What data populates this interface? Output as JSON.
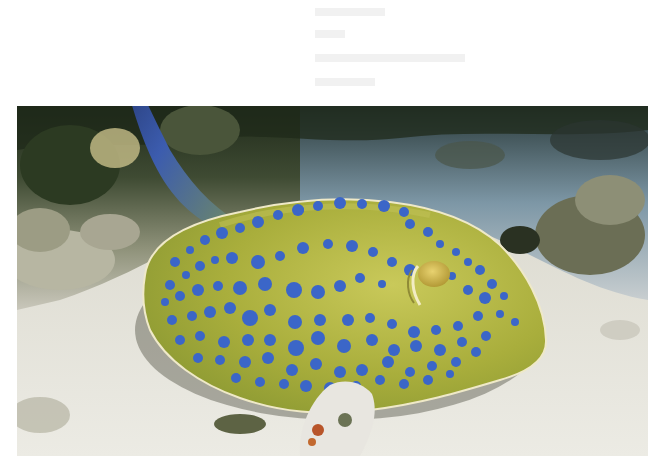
{
  "image": {
    "subject": "Blue-spotted stingray resting on sandy seabed beside coral reef",
    "width": 656,
    "height": 468,
    "page_background": "#ffffff",
    "photo_frame": {
      "x": 17,
      "y": 106,
      "width": 631,
      "height": 350
    }
  },
  "colors": {
    "reef_dark": "#1f2a1a",
    "reef_mid": "#4c5a3c",
    "reef_light": "#a9a98c",
    "water_blue": "#7d97a6",
    "sand": "#e4e2d8",
    "sand_shadow": "#c9c7bb",
    "ray_body": "#a9ae3c",
    "ray_body_light": "#c6c658",
    "ray_rim": "#efe9c8",
    "tail_blue": "#3c5cae",
    "tail_dark": "#1d2c5c",
    "spot_blue": "#3b66c8",
    "eye": "#d2b84a",
    "coral_white": "#e8e6e0",
    "coral_orange": "#b8552a"
  },
  "elements": {
    "tail": "Long blue tail rising from the ray's back up past the top of the photo frame",
    "eye": "Raised yellow eye with pale spiracle on the right side of the body",
    "coral_clump": "White coral fragment with orange bits in front of the ray",
    "reef": "Dark rocky reef across the upper part of the photo"
  },
  "spots": [
    [
      175,
      262,
      5
    ],
    [
      190,
      250,
      4
    ],
    [
      205,
      240,
      5
    ],
    [
      222,
      233,
      6
    ],
    [
      240,
      228,
      5
    ],
    [
      258,
      222,
      6
    ],
    [
      278,
      215,
      5
    ],
    [
      298,
      210,
      6
    ],
    [
      318,
      206,
      5
    ],
    [
      340,
      203,
      6
    ],
    [
      362,
      204,
      5
    ],
    [
      384,
      206,
      6
    ],
    [
      404,
      212,
      5
    ],
    [
      170,
      285,
      5
    ],
    [
      186,
      275,
      4
    ],
    [
      200,
      266,
      5
    ],
    [
      215,
      260,
      4
    ],
    [
      232,
      258,
      6
    ],
    [
      258,
      262,
      7
    ],
    [
      280,
      256,
      5
    ],
    [
      303,
      248,
      6
    ],
    [
      328,
      244,
      5
    ],
    [
      352,
      246,
      6
    ],
    [
      373,
      252,
      5
    ],
    [
      392,
      262,
      5
    ],
    [
      410,
      270,
      6
    ],
    [
      165,
      302,
      4
    ],
    [
      180,
      296,
      5
    ],
    [
      198,
      290,
      6
    ],
    [
      218,
      286,
      5
    ],
    [
      240,
      288,
      7
    ],
    [
      265,
      284,
      7
    ],
    [
      294,
      290,
      8
    ],
    [
      318,
      292,
      7
    ],
    [
      340,
      286,
      6
    ],
    [
      360,
      278,
      5
    ],
    [
      382,
      284,
      4
    ],
    [
      452,
      276,
      4
    ],
    [
      468,
      290,
      5
    ],
    [
      485,
      298,
      6
    ],
    [
      172,
      320,
      5
    ],
    [
      192,
      316,
      5
    ],
    [
      210,
      312,
      6
    ],
    [
      230,
      308,
      6
    ],
    [
      250,
      318,
      8
    ],
    [
      270,
      310,
      6
    ],
    [
      295,
      322,
      7
    ],
    [
      320,
      320,
      6
    ],
    [
      348,
      320,
      6
    ],
    [
      370,
      318,
      5
    ],
    [
      392,
      324,
      5
    ],
    [
      414,
      332,
      6
    ],
    [
      436,
      330,
      5
    ],
    [
      458,
      326,
      5
    ],
    [
      478,
      316,
      5
    ],
    [
      500,
      314,
      4
    ],
    [
      515,
      322,
      4
    ],
    [
      180,
      340,
      5
    ],
    [
      200,
      336,
      5
    ],
    [
      224,
      342,
      6
    ],
    [
      248,
      340,
      6
    ],
    [
      270,
      340,
      6
    ],
    [
      296,
      348,
      8
    ],
    [
      318,
      338,
      7
    ],
    [
      344,
      346,
      7
    ],
    [
      372,
      340,
      6
    ],
    [
      394,
      350,
      6
    ],
    [
      416,
      346,
      6
    ],
    [
      440,
      350,
      6
    ],
    [
      462,
      342,
      5
    ],
    [
      486,
      336,
      5
    ],
    [
      198,
      358,
      5
    ],
    [
      220,
      360,
      5
    ],
    [
      245,
      362,
      6
    ],
    [
      268,
      358,
      6
    ],
    [
      292,
      370,
      6
    ],
    [
      316,
      364,
      6
    ],
    [
      340,
      372,
      6
    ],
    [
      362,
      370,
      6
    ],
    [
      388,
      362,
      6
    ],
    [
      410,
      372,
      5
    ],
    [
      432,
      366,
      5
    ],
    [
      456,
      362,
      5
    ],
    [
      476,
      352,
      5
    ],
    [
      236,
      378,
      5
    ],
    [
      260,
      382,
      5
    ],
    [
      284,
      384,
      5
    ],
    [
      306,
      386,
      6
    ],
    [
      330,
      388,
      6
    ],
    [
      356,
      386,
      5
    ],
    [
      380,
      380,
      5
    ],
    [
      404,
      384,
      5
    ],
    [
      428,
      380,
      5
    ],
    [
      450,
      374,
      4
    ],
    [
      300,
      210,
      4
    ],
    [
      410,
      224,
      5
    ],
    [
      428,
      232,
      5
    ],
    [
      440,
      244,
      4
    ],
    [
      456,
      252,
      4
    ],
    [
      468,
      262,
      4
    ],
    [
      480,
      270,
      5
    ],
    [
      492,
      284,
      5
    ],
    [
      504,
      296,
      4
    ]
  ]
}
